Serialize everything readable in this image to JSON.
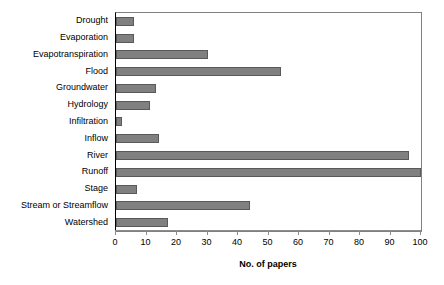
{
  "chart_data": {
    "type": "bar",
    "orientation": "horizontal",
    "title": "",
    "xlabel": "No. of papers",
    "ylabel": "",
    "xlim": [
      0,
      100
    ],
    "xticks": [
      0,
      10,
      20,
      30,
      40,
      50,
      60,
      70,
      80,
      90,
      100
    ],
    "grid": false,
    "legend": null,
    "bar_color": "#808080",
    "bar_edge_color": "#595959",
    "categories": [
      "Drought",
      "Evaporation",
      "Evapotranspiration",
      "Flood",
      "Groundwater",
      "Hydrology",
      "Infiltration",
      "Inflow",
      "River",
      "Runoff",
      "Stage",
      "Stream or Streamflow",
      "Watershed"
    ],
    "values": [
      6,
      6,
      30,
      54,
      13,
      11,
      2,
      14,
      96,
      101,
      7,
      44,
      17
    ]
  }
}
